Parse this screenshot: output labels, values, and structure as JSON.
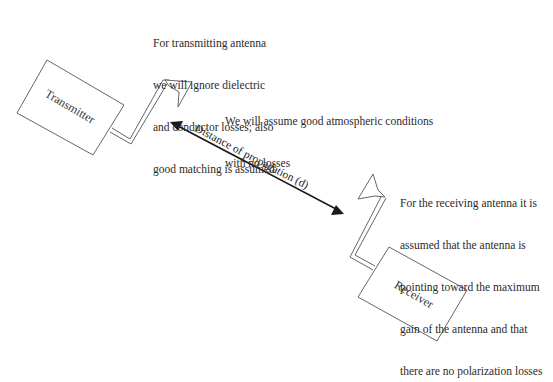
{
  "diagram": {
    "transmitter": {
      "label": "Transmitter"
    },
    "receiver": {
      "label": "Receiver"
    },
    "propagation": {
      "label": "Distance of propagation (d)"
    },
    "notes": {
      "transmitting_antenna": [
        "For transmitting antenna",
        "we will ignore dielectric",
        "and conductor losses; also",
        "good matching is assumed"
      ],
      "atmosphere": [
        "We will assume good atmospheric conditions",
        "with no losses"
      ],
      "receiving_antenna": [
        "For the receiving antenna it is",
        "assumed that the antenna is",
        "pointing toward the maximum",
        "gain of the antenna and that",
        "there are no polarization losses"
      ]
    },
    "colors": {
      "line": "#555555",
      "arrow": "#1a1a1a",
      "text": "#2a2a2a"
    }
  }
}
